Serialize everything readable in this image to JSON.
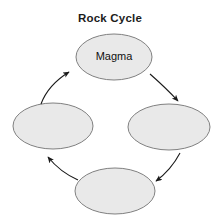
{
  "diagram": {
    "title": "Rock Cycle",
    "background_color": "#ffffff",
    "node_fill_color": "#e8e8e8",
    "node_stroke_color": "#808080",
    "arrow_color": "#1a1a1a",
    "title_color": "#1c1c1c",
    "nodes": [
      {
        "id": "magma",
        "label": "Magma",
        "position": "top",
        "cx": 114,
        "cy": 57,
        "rx": 38,
        "ry": 23
      },
      {
        "id": "left",
        "label": "",
        "position": "left",
        "cx": 53,
        "cy": 126,
        "rx": 40,
        "ry": 23
      },
      {
        "id": "right",
        "label": "",
        "position": "right",
        "cx": 169,
        "cy": 127,
        "rx": 41,
        "ry": 23
      },
      {
        "id": "bottom",
        "label": "",
        "position": "bottom",
        "cx": 115,
        "cy": 191,
        "rx": 40,
        "ry": 23
      }
    ],
    "arrows": [
      {
        "id": "arrow-bottom-to-left",
        "from": "bottom",
        "to": "left",
        "direction": "up-left"
      },
      {
        "id": "arrow-left-to-magma",
        "from": "left",
        "to": "magma",
        "direction": "up-right"
      },
      {
        "id": "arrow-magma-to-right",
        "from": "magma",
        "to": "right",
        "direction": "down-right"
      },
      {
        "id": "arrow-right-to-bottom",
        "from": "right",
        "to": "bottom",
        "direction": "down-left"
      }
    ],
    "cycle_direction": "clockwise"
  }
}
